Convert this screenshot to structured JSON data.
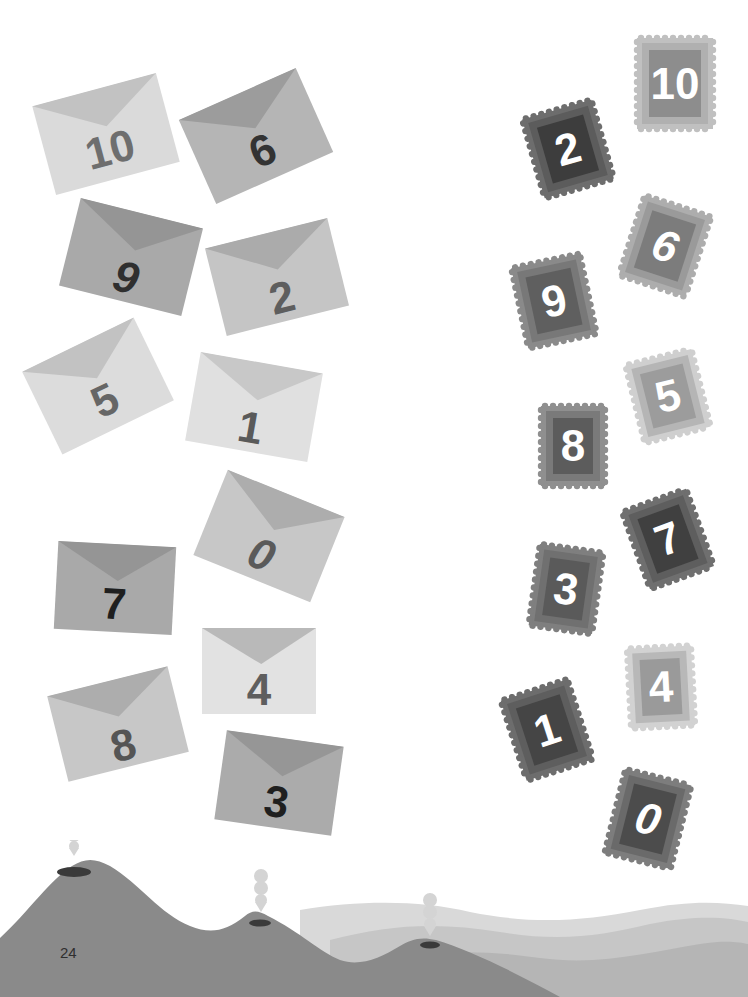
{
  "page": {
    "number": "24"
  },
  "colors": {
    "background": "#ffffff",
    "hill": "#8a8a8a",
    "crater": "#3a3a3a",
    "wave_light": "#d6d6d6",
    "wave_mid": "#c4c4c4",
    "wave_dark": "#b3b3b3",
    "smoke": "#d4d4d4"
  },
  "envelopes": [
    {
      "label": "10",
      "x": 42,
      "y": 88,
      "w": 128,
      "h": 92,
      "rot": -15,
      "body": "#dadada",
      "flap": "#c2c2c2",
      "text": "#6e6e6e",
      "num_top": 40
    },
    {
      "label": "6",
      "x": 192,
      "y": 90,
      "w": 128,
      "h": 92,
      "rot": -24,
      "body": "#b5b5b5",
      "flap": "#9c9c9c",
      "text": "#333333",
      "num_top": 40
    },
    {
      "label": "9",
      "x": 68,
      "y": 212,
      "w": 126,
      "h": 90,
      "rot": 14,
      "body": "#a9a9a9",
      "flap": "#959595",
      "text": "#2f2f2f",
      "num_top": 44,
      "italic": true
    },
    {
      "label": "2",
      "x": 214,
      "y": 232,
      "w": 126,
      "h": 90,
      "rot": -14,
      "body": "#c5c5c5",
      "flap": "#ababab",
      "text": "#5e5e5e",
      "num_top": 44
    },
    {
      "label": "5",
      "x": 36,
      "y": 340,
      "w": 124,
      "h": 92,
      "rot": -26,
      "body": "#dcdcdc",
      "flap": "#c2c2c2",
      "text": "#666666",
      "num_top": 40
    },
    {
      "label": "1",
      "x": 192,
      "y": 362,
      "w": 124,
      "h": 90,
      "rot": 10,
      "body": "#e0e0e0",
      "flap": "#c8c8c8",
      "text": "#5a5a5a",
      "num_top": 44
    },
    {
      "label": "0",
      "x": 206,
      "y": 490,
      "w": 126,
      "h": 92,
      "rot": 22,
      "body": "#c7c7c7",
      "flap": "#adadad",
      "text": "#5a5a5a",
      "num_top": 44,
      "italic": true
    },
    {
      "label": "7",
      "x": 56,
      "y": 544,
      "w": 118,
      "h": 88,
      "rot": 3,
      "body": "#a9a9a9",
      "flap": "#959595",
      "text": "#1f1f1f",
      "num_top": 38
    },
    {
      "label": "4",
      "x": 202,
      "y": 628,
      "w": 114,
      "h": 86,
      "rot": 0,
      "body": "#e2e2e2",
      "flap": "#b9b9b9",
      "text": "#5e5e5e",
      "num_top": 40
    },
    {
      "label": "8",
      "x": 56,
      "y": 680,
      "w": 124,
      "h": 88,
      "rot": -14,
      "body": "#c7c7c7",
      "flap": "#adadad",
      "text": "#555555",
      "num_top": 44
    },
    {
      "label": "3",
      "x": 220,
      "y": 738,
      "w": 118,
      "h": 90,
      "rot": 8,
      "body": "#ababab",
      "flap": "#969696",
      "text": "#1f1f1f",
      "num_top": 42
    }
  ],
  "stamps": [
    {
      "label": "10",
      "x": 633,
      "y": 34,
      "w": 84,
      "h": 99,
      "rot": 0,
      "edge": "#c0c0c0",
      "frame": "#b0b0b0",
      "inner": "#8d8d8d"
    },
    {
      "label": "2",
      "x": 528,
      "y": 104,
      "w": 80,
      "h": 90,
      "rot": -16,
      "edge": "#6d6d6d",
      "frame": "#5c5c5c",
      "inner": "#3d3d3d"
    },
    {
      "label": "6",
      "x": 626,
      "y": 200,
      "w": 78,
      "h": 92,
      "rot": 18,
      "edge": "#adadad",
      "frame": "#9a9a9a",
      "inner": "#7c7c7c",
      "italic": true
    },
    {
      "label": "9",
      "x": 515,
      "y": 256,
      "w": 78,
      "h": 90,
      "rot": -12,
      "edge": "#8a8a8a",
      "frame": "#787878",
      "inner": "#5f5f5f"
    },
    {
      "label": "5",
      "x": 630,
      "y": 352,
      "w": 76,
      "h": 88,
      "rot": -14,
      "edge": "#cfcfcf",
      "frame": "#b5b5b5",
      "inner": "#9c9c9c"
    },
    {
      "label": "8",
      "x": 537,
      "y": 402,
      "w": 72,
      "h": 88,
      "rot": 0,
      "edge": "#8f8f8f",
      "frame": "#7a7a7a",
      "inner": "#5c5c5c"
    },
    {
      "label": "7",
      "x": 630,
      "y": 494,
      "w": 76,
      "h": 90,
      "rot": -20,
      "edge": "#6f6f6f",
      "frame": "#5e5e5e",
      "inner": "#404040"
    },
    {
      "label": "3",
      "x": 530,
      "y": 544,
      "w": 72,
      "h": 90,
      "rot": 8,
      "edge": "#7f7f7f",
      "frame": "#707070",
      "inner": "#5a5a5a"
    },
    {
      "label": "4",
      "x": 625,
      "y": 643,
      "w": 72,
      "h": 88,
      "rot": -3,
      "edge": "#d2d2d2",
      "frame": "#b8b8b8",
      "inner": "#9a9a9a"
    },
    {
      "label": "1",
      "x": 508,
      "y": 684,
      "w": 78,
      "h": 92,
      "rot": -18,
      "edge": "#6d6d6d",
      "frame": "#5e5e5e",
      "inner": "#454545"
    },
    {
      "label": "0",
      "x": 610,
      "y": 772,
      "w": 76,
      "h": 94,
      "rot": 14,
      "edge": "#7d7d7d",
      "frame": "#6a6a6a",
      "inner": "#4c4c4c",
      "italic": true
    }
  ]
}
